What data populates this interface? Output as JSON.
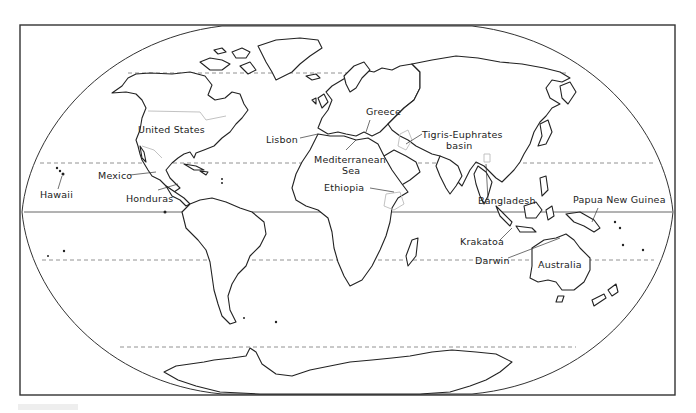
{
  "map": {
    "projection": "world outline map",
    "latitude_lines": [
      {
        "name": "arctic-circle",
        "style": "dashed"
      },
      {
        "name": "tropic-of-cancer",
        "style": "dashed"
      },
      {
        "name": "equator",
        "style": "solid"
      },
      {
        "name": "tropic-of-capricorn",
        "style": "dashed"
      },
      {
        "name": "antarctic-circle",
        "style": "dashed"
      }
    ],
    "labels": {
      "united_states": "United States",
      "mexico": "Mexico",
      "hawaii": "Hawaii",
      "honduras": "Honduras",
      "lisbon": "Lisbon",
      "greece": "Greece",
      "mediterranean_1": "Mediterranean",
      "mediterranean_2": "Sea",
      "tigris_1": "Tigris-Euphrates",
      "tigris_2": "basin",
      "ethiopia": "Ethiopia",
      "bangladesh": "Bangladesh",
      "papua": "Papua New Guinea",
      "krakatoa": "Krakatoa",
      "darwin": "Darwin",
      "australia": "Australia"
    }
  }
}
